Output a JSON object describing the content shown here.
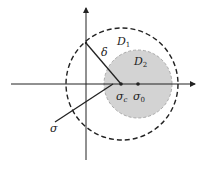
{
  "diagram": {
    "type": "complex-plane-disks",
    "colors": {
      "stroke": "#222222",
      "shaded_fill": "#d3d3d3",
      "background": "#ffffff"
    },
    "axes": {
      "horizontal": {
        "x1": 11,
        "x2": 195,
        "y": 84,
        "arrow": "right"
      },
      "vertical": {
        "x": 86,
        "y1": 160,
        "y2": 8,
        "arrow": "up"
      }
    },
    "disks": [
      {
        "id": "D1",
        "label_base": "D",
        "label_sub": "1",
        "cx": 122,
        "cy": 84,
        "r": 56,
        "style": "dashed",
        "filled": false,
        "label_x": 117,
        "label_y": 45
      },
      {
        "id": "D2",
        "label_base": "D",
        "label_sub": "2",
        "cx": 138,
        "cy": 84,
        "r": 34,
        "style": "dashed",
        "filled": true,
        "label_x": 134,
        "label_y": 65
      }
    ],
    "points": [
      {
        "id": "sigma_c",
        "label_base": "σ",
        "label_sub": "c",
        "x": 121,
        "y": 84,
        "label_x": 116,
        "label_y": 100
      },
      {
        "id": "sigma_0",
        "label_base": "σ",
        "label_sub": "0",
        "x": 138,
        "y": 84,
        "label_x": 133,
        "label_y": 100
      }
    ],
    "segments": [
      {
        "id": "delta",
        "label": "δ",
        "x1": 86,
        "y1": 43,
        "x2": 121,
        "y2": 84,
        "label_x": 101,
        "label_y": 56
      },
      {
        "id": "sigma",
        "label": "σ",
        "x1": 55,
        "y1": 122,
        "x2": 113,
        "y2": 84,
        "label_x": 50,
        "label_y": 132
      }
    ]
  }
}
